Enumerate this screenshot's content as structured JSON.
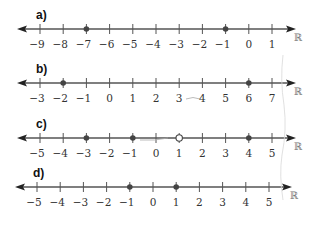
{
  "number_set_symbol": "ℝ",
  "colors": {
    "line": "#555555",
    "point": "#444444",
    "label": "#111111",
    "tick_label": "#333333",
    "reals": "#777777",
    "pencil": "#aaaaaa"
  },
  "lines": [
    {
      "id": "a",
      "label": "a)",
      "y": 29,
      "x_start": 17,
      "x_end": 296,
      "first_tick_x": 40,
      "tick_spacing": 23.2,
      "ticks": [
        "−9",
        "−8",
        "−7",
        "−6",
        "−5",
        "−4",
        "−3",
        "−2",
        "−1",
        "0",
        "1"
      ],
      "points": [
        {
          "value": -7,
          "type": "closed"
        },
        {
          "value": -1,
          "type": "closed"
        }
      ]
    },
    {
      "id": "b",
      "label": "b)",
      "y": 83,
      "x_start": 17,
      "x_end": 296,
      "first_tick_x": 40,
      "tick_spacing": 23.2,
      "ticks": [
        "−3",
        "−2",
        "−1",
        "0",
        "1",
        "2",
        "3",
        "4",
        "5",
        "6",
        "7"
      ],
      "points": [
        {
          "value": -2,
          "type": "closed"
        },
        {
          "value": 6,
          "type": "closed"
        }
      ]
    },
    {
      "id": "c",
      "label": "c)",
      "y": 138,
      "x_start": 17,
      "x_end": 296,
      "first_tick_x": 40,
      "tick_spacing": 23.2,
      "ticks": [
        "−5",
        "−4",
        "−3",
        "−2",
        "−1",
        "0",
        "1",
        "2",
        "3",
        "4",
        "5"
      ],
      "points": [
        {
          "value": -3,
          "type": "closed"
        },
        {
          "value": -1,
          "type": "closed"
        },
        {
          "value": 1,
          "type": "open"
        },
        {
          "value": 4,
          "type": "closed"
        }
      ]
    },
    {
      "id": "d",
      "label": "d)",
      "y": 187,
      "x_start": 15,
      "x_end": 292,
      "first_tick_x": 37,
      "tick_spacing": 23.2,
      "ticks": [
        "−5",
        "−4",
        "−3",
        "−2",
        "−1",
        "0",
        "1",
        "2",
        "3",
        "4",
        "5"
      ],
      "points": [
        {
          "value": -1,
          "type": "closed"
        },
        {
          "value": 1,
          "type": "closed"
        }
      ]
    }
  ]
}
